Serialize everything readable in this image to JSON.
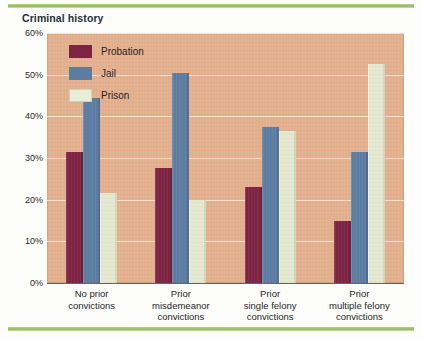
{
  "chart_title": "Criminal history",
  "legend": {
    "items": [
      {
        "label": "Probation",
        "color": "#7d2344",
        "icon": "legend-swatch-probation"
      },
      {
        "label": "Jail",
        "color": "#5c7da3",
        "icon": "legend-swatch-jail"
      },
      {
        "label": "Prison",
        "color": "#e4e8cf",
        "icon": "legend-swatch-prison"
      }
    ]
  },
  "axis": {
    "y_ticks": [
      "0%",
      "10%",
      "20%",
      "30%",
      "40%",
      "50%",
      "60%"
    ],
    "x_labels": [
      "No prior\nconvictions",
      "Prior\nmisdemeanor\nconvictions",
      "Prior\nsingle felony\nconvictions",
      "Prior\nmultiple felony\nconvictions"
    ]
  },
  "colors": {
    "probation": "#7d2344",
    "jail": "#5c7da3",
    "prison": "#e4e8cf",
    "plot_background": "#e3b08e",
    "gridline": "#f3e3d4",
    "rule_green": "#8fb85c",
    "title_text": "#23313a"
  },
  "chart_data": {
    "type": "bar",
    "title": "Criminal history",
    "xlabel": "",
    "ylabel": "",
    "ylim": [
      0,
      60
    ],
    "ytick_values": [
      0,
      10,
      20,
      30,
      40,
      50,
      60
    ],
    "ytick_labels": [
      "0%",
      "10%",
      "20%",
      "30%",
      "40%",
      "50%",
      "60%"
    ],
    "grid": true,
    "legend_position": "top-left-inside",
    "units": "percent",
    "categories": [
      "No prior convictions",
      "Prior misdemeanor convictions",
      "Prior single felony convictions",
      "Prior multiple felony convictions"
    ],
    "series": [
      {
        "name": "Probation",
        "color": "#7d2344",
        "values": [
          31.5,
          27.5,
          23.0,
          15.0
        ]
      },
      {
        "name": "Jail",
        "color": "#5c7da3",
        "values": [
          44.5,
          50.5,
          37.5,
          31.5
        ]
      },
      {
        "name": "Prison",
        "color": "#e4e8cf",
        "values": [
          21.5,
          20.0,
          36.5,
          52.5
        ]
      }
    ]
  }
}
